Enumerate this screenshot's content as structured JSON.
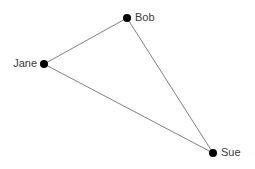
{
  "canvas": {
    "width": 255,
    "height": 169,
    "background_color": "#ffffff"
  },
  "style": {
    "node_color": "#000000",
    "node_radius": 4,
    "edge_color": "#808080",
    "edge_width": 1,
    "label_color": "#3a3a3a",
    "label_font_size": 11
  },
  "graph": {
    "nodes": [
      {
        "id": "bob",
        "label": "Bob",
        "x": 127,
        "y": 18,
        "label_x": 135,
        "label_y": 12,
        "label_side": "right"
      },
      {
        "id": "jane",
        "label": "Jane",
        "x": 44,
        "y": 64,
        "label_x": 10,
        "label_y": 58,
        "label_side": "left"
      },
      {
        "id": "sue",
        "label": "Sue",
        "x": 213,
        "y": 153,
        "label_x": 221,
        "label_y": 147,
        "label_side": "right"
      }
    ],
    "edges": [
      {
        "id": "jane-bob",
        "from": "jane",
        "to": "bob",
        "x1": 44,
        "y1": 64,
        "x2": 127,
        "y2": 18
      },
      {
        "id": "bob-sue",
        "from": "bob",
        "to": "sue",
        "x1": 127,
        "y1": 18,
        "x2": 213,
        "y2": 153
      },
      {
        "id": "jane-sue",
        "from": "jane",
        "to": "sue",
        "x1": 44,
        "y1": 64,
        "x2": 213,
        "y2": 153
      }
    ]
  }
}
